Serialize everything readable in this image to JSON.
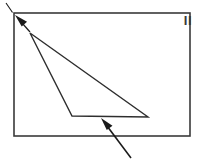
{
  "figure": {
    "panel_label": "II",
    "background_color": "#ffffff",
    "stroke_color": "#3a3a3a",
    "arrow_color": "#1a1a1a",
    "frame": {
      "x": 14,
      "y": 13,
      "width": 176,
      "height": 123,
      "stroke_width": 1.6
    },
    "triangle": {
      "apex": {
        "x": 30,
        "y": 33
      },
      "bottom_left": {
        "x": 72,
        "y": 116
      },
      "bottom_right": {
        "x": 148,
        "y": 117
      },
      "stroke_width": 1.4
    },
    "annotations": [
      {
        "name": "apex-arrow",
        "description": "arrow pointing to the triangle apex at upper left",
        "tail": {
          "x": 30,
          "y": 32
        },
        "tip": {
          "x": 15,
          "y": 15
        },
        "leader": {
          "x": 6,
          "y": 3
        },
        "stroke_width": 1.2
      },
      {
        "name": "base-arrow",
        "description": "arrow pointing to the triangle base from lower right",
        "tail": {
          "x": 131,
          "y": 158
        },
        "tip": {
          "x": 101,
          "y": 118
        },
        "stroke_width": 1.6
      }
    ]
  }
}
